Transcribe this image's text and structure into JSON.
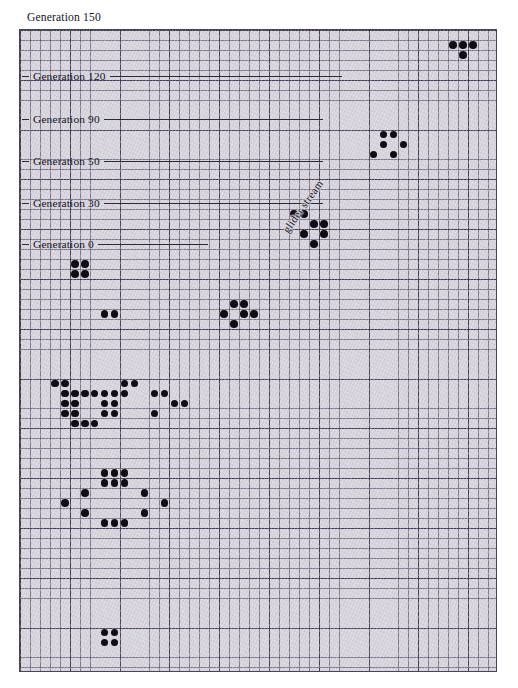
{
  "figure": {
    "title": "Generation 150",
    "background_color": "#ffffff",
    "grid_color": "#d6d3dd",
    "grid_line_color": "#483f58",
    "cell_color": "#100d14",
    "grid": {
      "cols": 48,
      "rows": 64,
      "cell_px": 9.96,
      "major_every": 5
    }
  },
  "annotations": {
    "glider_stream_label": "glider stream"
  },
  "generations": [
    {
      "label": "Generation 120",
      "y": 70,
      "rule_width": 232
    },
    {
      "label": "Generation 90",
      "y": 113,
      "rule_width": 219
    },
    {
      "label": "Generation 50",
      "y": 155,
      "rule_width": 219
    },
    {
      "label": "Generation 30",
      "y": 197,
      "rule_width": 219
    },
    {
      "label": "Generation 0",
      "y": 238,
      "rule_width": 110
    }
  ],
  "chart_data": {
    "type": "scatter",
    "title": "Generation 150",
    "xlabel": "",
    "ylabel": "",
    "xlim": [
      0,
      48
    ],
    "ylim": [
      0,
      64
    ],
    "grid": true,
    "legend": "none",
    "categories": [],
    "values": [],
    "series": [
      {
        "name": "live cells",
        "comment": "grid coordinates (col,row), origin top-left of the graph paper, 0-indexed",
        "points": [
          [
            43,
            1
          ],
          [
            44,
            1
          ],
          [
            45,
            1
          ],
          [
            44,
            2
          ],
          [
            36,
            10
          ],
          [
            37,
            10
          ],
          [
            36,
            11
          ],
          [
            38,
            11
          ],
          [
            35,
            12
          ],
          [
            37,
            12
          ],
          [
            27,
            18
          ],
          [
            28,
            18
          ],
          [
            29,
            19
          ],
          [
            30,
            19
          ],
          [
            28,
            20
          ],
          [
            30,
            20
          ],
          [
            29,
            21
          ],
          [
            5,
            23
          ],
          [
            6,
            23
          ],
          [
            5,
            24
          ],
          [
            6,
            24
          ],
          [
            21,
            27
          ],
          [
            22,
            27
          ],
          [
            20,
            28
          ],
          [
            22,
            28
          ],
          [
            23,
            28
          ],
          [
            21,
            29
          ],
          [
            8,
            28
          ],
          [
            9,
            28
          ],
          [
            3,
            35
          ],
          [
            4,
            35
          ],
          [
            10,
            35
          ],
          [
            11,
            35
          ],
          [
            4,
            36
          ],
          [
            5,
            36
          ],
          [
            6,
            36
          ],
          [
            7,
            36
          ],
          [
            8,
            36
          ],
          [
            9,
            36
          ],
          [
            10,
            36
          ],
          [
            13,
            36
          ],
          [
            14,
            36
          ],
          [
            4,
            37
          ],
          [
            5,
            37
          ],
          [
            8,
            37
          ],
          [
            9,
            37
          ],
          [
            15,
            37
          ],
          [
            16,
            37
          ],
          [
            4,
            38
          ],
          [
            5,
            38
          ],
          [
            8,
            38
          ],
          [
            9,
            38
          ],
          [
            13,
            38
          ],
          [
            5,
            39
          ],
          [
            6,
            39
          ],
          [
            7,
            39
          ],
          [
            8,
            44
          ],
          [
            9,
            44
          ],
          [
            10,
            44
          ],
          [
            8,
            45
          ],
          [
            9,
            45
          ],
          [
            10,
            45
          ],
          [
            6,
            46
          ],
          [
            12,
            46
          ],
          [
            4,
            47
          ],
          [
            14,
            47
          ],
          [
            6,
            48
          ],
          [
            12,
            48
          ],
          [
            8,
            49
          ],
          [
            9,
            49
          ],
          [
            10,
            49
          ],
          [
            8,
            60
          ],
          [
            9,
            60
          ],
          [
            8,
            61
          ],
          [
            9,
            61
          ]
        ]
      }
    ]
  }
}
